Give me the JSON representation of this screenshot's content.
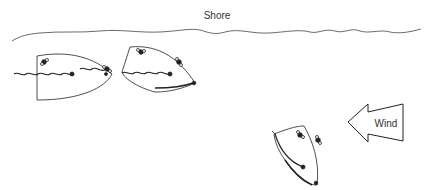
{
  "labels": {
    "shore": "Shore",
    "wind": "Wind"
  },
  "boats": [
    {
      "name": "boat-left",
      "description": "boat with sail luffing"
    },
    {
      "name": "boat-middle",
      "description": "boat with jib luffing"
    },
    {
      "name": "boat-right",
      "description": "boat sailing with wind"
    }
  ],
  "colors": {
    "stroke": "#222222",
    "text": "#333333"
  }
}
